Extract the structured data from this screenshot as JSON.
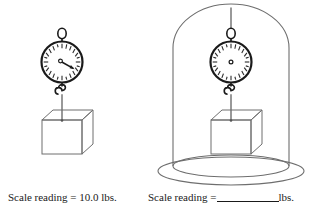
{
  "figure": {
    "background_color": "#ffffff",
    "line_color": "#1a1a1a",
    "thin_line_color": "#6e6e6e",
    "panels": [
      {
        "id": "left-panel",
        "name": "block-in-air",
        "scale": {
          "name": "spring-scale",
          "dial_tick_count": 24,
          "needle_visible": true,
          "needle_angle_deg": 118,
          "hanger_ring": true,
          "hook": true
        },
        "block": {
          "name": "hanging-block",
          "shape": "cube"
        },
        "enclosure": null
      },
      {
        "id": "right-panel",
        "name": "block-in-bell-jar",
        "scale": {
          "name": "spring-scale",
          "dial_tick_count": 24,
          "needle_visible": false,
          "needle_angle_deg": null,
          "hanger_ring": true,
          "hook": true
        },
        "block": {
          "name": "hanging-block",
          "shape": "cube"
        },
        "enclosure": {
          "name": "bell-jar",
          "shape": "dome",
          "base": "elliptical-platform"
        }
      }
    ]
  },
  "captions": {
    "left": {
      "label": "Scale reading = 10.0 lbs.",
      "prefix": "Scale reading = ",
      "value": "10.0",
      "units": "lbs."
    },
    "right": {
      "prefix": "Scale reading =",
      "value": "",
      "units": "lbs."
    }
  }
}
